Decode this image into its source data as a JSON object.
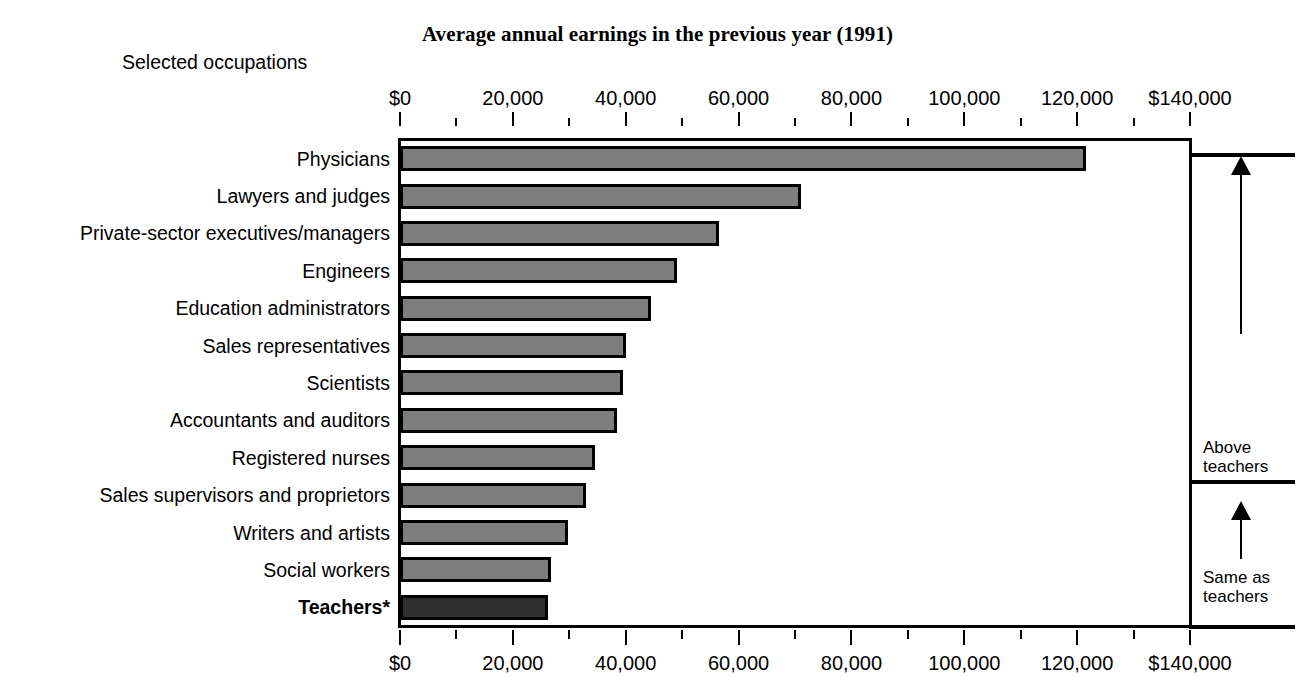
{
  "title": "Average annual earnings in the previous year (1991)",
  "subtitle": "Selected occupations",
  "annotations": {
    "above_teachers_line1": "Above",
    "above_teachers_line2": "teachers",
    "same_as_teachers_line1": "Same as",
    "same_as_teachers_line2": "teachers"
  },
  "colors": {
    "bar_fill": "#7d7d7d",
    "bar_highlight_fill": "#2f2f2f",
    "bar_border": "#000000",
    "axis": "#000000",
    "background": "#ffffff"
  },
  "chart_data": {
    "type": "bar",
    "orientation": "horizontal",
    "title": "Average annual earnings in the previous year (1991)",
    "subtitle": "Selected occupations",
    "xlabel": "",
    "ylabel": "Selected occupations",
    "xlim": [
      0,
      140000
    ],
    "grid": false,
    "legend": null,
    "tick_labels": [
      "$0",
      "20,000",
      "40,000",
      "60,000",
      "80,000",
      "100,000",
      "120,000",
      "$140,000"
    ],
    "tick_values": [
      0,
      20000,
      40000,
      60000,
      80000,
      100000,
      120000,
      140000
    ],
    "minor_tick_interval": 10000,
    "categories": [
      "Physicians",
      "Lawyers and judges",
      "Private-sector executives/managers",
      "Engineers",
      "Education administrators",
      "Sales representatives",
      "Scientists",
      "Accountants and auditors",
      "Registered nurses",
      "Sales supervisors and proprietors",
      "Writers and artists",
      "Social workers",
      "Teachers*"
    ],
    "values": [
      121500,
      71000,
      56500,
      49000,
      44500,
      40000,
      39500,
      38500,
      34500,
      33000,
      29800,
      26800,
      26300
    ],
    "highlight_category": "Teachers*",
    "annotations": [
      {
        "label": "Above teachers",
        "categories_from": "Physicians",
        "categories_to": "Sales supervisors and proprietors"
      },
      {
        "label": "Same as teachers",
        "categories_from": "Writers and artists",
        "categories_to": "Teachers*"
      }
    ]
  }
}
